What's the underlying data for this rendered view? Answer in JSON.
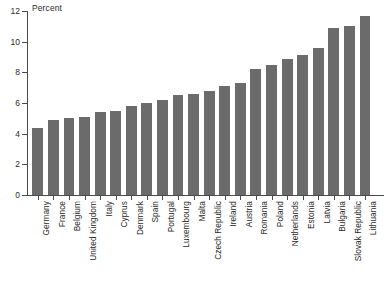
{
  "chart_data": {
    "type": "bar",
    "title": "",
    "subtitle": "",
    "xlabel": "",
    "ylabel": "Percent",
    "ylim": [
      0,
      12
    ],
    "y_ticks": [
      0,
      2,
      4,
      6,
      8,
      10,
      12
    ],
    "grid": false,
    "legend": null,
    "bar_color": "#6b6b6b",
    "axis_color": "#4a4a4a",
    "categories": [
      "Germany",
      "France",
      "Belgium",
      "United Kingdom",
      "Italy",
      "Cyprus",
      "Denmark",
      "Spain",
      "Portugal",
      "Luxembourg",
      "Malta",
      "Czech Republic",
      "Ireland",
      "Austria",
      "Romania",
      "Poland",
      "Netherlands",
      "Estonia",
      "Latvia",
      "Bulgaria",
      "Slovak Republic",
      "Lithuania"
    ],
    "values": [
      4.4,
      4.9,
      5.0,
      5.1,
      5.4,
      5.5,
      5.8,
      6.0,
      6.2,
      6.5,
      6.6,
      6.8,
      7.1,
      7.3,
      8.2,
      8.5,
      8.9,
      9.1,
      9.6,
      10.9,
      11.0,
      11.7
    ]
  }
}
